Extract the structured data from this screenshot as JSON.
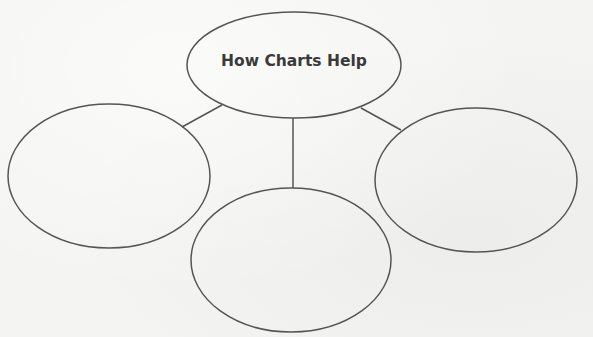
{
  "diagram": {
    "type": "web-organizer",
    "center_node": {
      "label": "How Charts Help",
      "cx": 294,
      "cy": 65,
      "rx": 107,
      "ry": 53
    },
    "branch_nodes": [
      {
        "id": "left",
        "label": "",
        "cx": 109,
        "cy": 176,
        "rx": 101,
        "ry": 72
      },
      {
        "id": "bottom",
        "label": "",
        "cx": 291,
        "cy": 260,
        "rx": 100,
        "ry": 72
      },
      {
        "id": "right",
        "label": "",
        "cx": 476,
        "cy": 180,
        "rx": 101,
        "ry": 72
      }
    ],
    "connectors": [
      {
        "from": "center",
        "to": "left",
        "x1": 222,
        "y1": 105,
        "x2": 182,
        "y2": 127
      },
      {
        "from": "center",
        "to": "bottom",
        "x1": 293,
        "y1": 118,
        "x2": 293,
        "y2": 188
      },
      {
        "from": "center",
        "to": "right",
        "x1": 361,
        "y1": 108,
        "x2": 401,
        "y2": 130
      }
    ],
    "stroke_color": "#555555",
    "text_color": "#3a3a3a"
  }
}
